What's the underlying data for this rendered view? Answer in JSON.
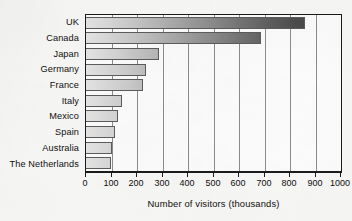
{
  "chart_data": {
    "type": "bar",
    "orientation": "horizontal",
    "title": "",
    "xlabel": "Number of visitors (thousands)",
    "ylabel": "",
    "categories": [
      "UK",
      "Canada",
      "Japan",
      "Germany",
      "France",
      "Italy",
      "Mexico",
      "Spain",
      "Australia",
      "The Netherlands"
    ],
    "values": [
      860,
      685,
      285,
      235,
      222,
      142,
      127,
      115,
      103,
      98
    ],
    "xlim": [
      0,
      1000
    ],
    "xticks": [
      0,
      100,
      200,
      300,
      400,
      500,
      600,
      700,
      800,
      900,
      1000
    ],
    "xtick_labels": [
      "0",
      "100",
      "200",
      "300",
      "400",
      "500",
      "600",
      "700",
      "800",
      "900",
      "1000"
    ],
    "grid": "vertical",
    "legend": null,
    "bar_fill": "horizontal-gradient-light-to-dark",
    "colors": {
      "gradient_start": "#e8e8e8",
      "gradient_end": "#3d3d3d",
      "bar_outline": "#5d5d5d",
      "axis": "#1b1b1b",
      "gridline": "#8d8d8d",
      "plot_background": "#ffffff",
      "page_background": "#fbfbfa",
      "text": "#100e0c"
    }
  }
}
